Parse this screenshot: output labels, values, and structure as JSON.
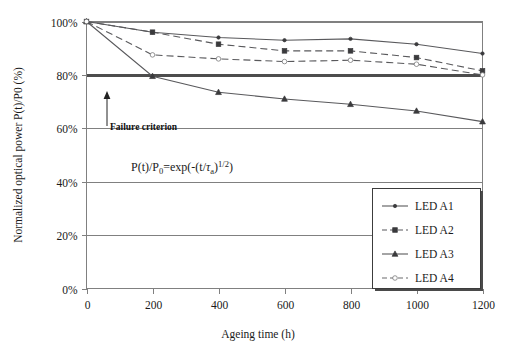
{
  "chart_data": {
    "type": "line",
    "title": "",
    "xlabel": "Ageing time (h)",
    "ylabel": "Normalized optical power P(t)/P0 (%)",
    "x": [
      0,
      200,
      400,
      600,
      800,
      1000,
      1200
    ],
    "xlim": [
      0,
      1200
    ],
    "ylim": [
      0,
      100
    ],
    "xticks": [
      "0",
      "200",
      "400",
      "600",
      "800",
      "1000",
      "1200"
    ],
    "yticks": [
      "0%",
      "20%",
      "40%",
      "60%",
      "80%",
      "100%"
    ],
    "ytick_values": [
      0,
      20,
      40,
      60,
      80,
      100
    ],
    "grid": true,
    "legend_position": "lower-right",
    "series": [
      {
        "name": "LED A1",
        "values": [
          100,
          96,
          94,
          93,
          93.5,
          91.5,
          88
        ],
        "line_style": "solid",
        "marker": "dot",
        "color": "#59595c"
      },
      {
        "name": "LED A2",
        "values": [
          100,
          96,
          91.5,
          89,
          89,
          86.5,
          81.5
        ],
        "line_style": "dashed",
        "marker": "square",
        "color": "#59595c"
      },
      {
        "name": "LED A3",
        "values": [
          100,
          79.5,
          73.5,
          71,
          69,
          66.5,
          62.5
        ],
        "line_style": "solid",
        "marker": "triangle",
        "color": "#59595c"
      },
      {
        "name": "LED A4",
        "values": [
          100,
          87.5,
          86,
          85,
          85.5,
          84,
          80
        ],
        "line_style": "dashed",
        "marker": "circle-open",
        "color": "#6a6a6c"
      }
    ],
    "annotations": [
      {
        "id": "failure-criterion",
        "text": "Failure criterion",
        "type": "arrow-label",
        "target_value": 80,
        "target_x": 65
      },
      {
        "id": "model-equation",
        "text": "P(t)/P₀=exp(-(t/τₐ)¹ᐟ²)",
        "type": "text",
        "x": 260,
        "y": 50
      }
    ],
    "reference_lines": [
      {
        "id": "failure-threshold",
        "value": 80,
        "emphasis": "bold"
      }
    ]
  },
  "annotation_parts": {
    "failure_label": "Failure criterion",
    "eq_main": "P(t)/P",
    "eq_sub0": "0",
    "eq_mid": "=exp(-(t/",
    "eq_tau": "τ",
    "eq_tau_sub": "a",
    "eq_close": ")",
    "eq_exp_num": "1/2",
    "eq_end": ")"
  },
  "legend": {
    "items": [
      {
        "label": "LED A1"
      },
      {
        "label": "LED A2"
      },
      {
        "label": "LED A3"
      },
      {
        "label": "LED A4"
      }
    ]
  }
}
